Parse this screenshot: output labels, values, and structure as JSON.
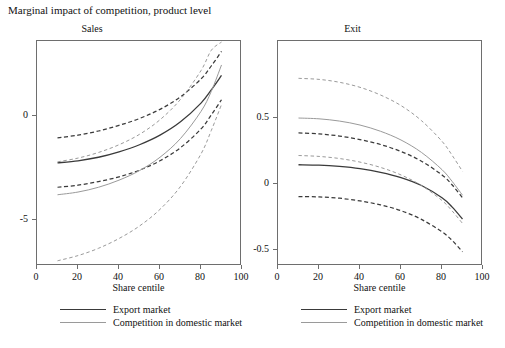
{
  "figure": {
    "title": "Marginal impact of competition, product level"
  },
  "colors": {
    "export_market": "#3a3a3a",
    "domestic_competition": "#9a9a9a",
    "axis": "#6e6e6e",
    "text": "#111111",
    "background": "#ffffff"
  },
  "legend": {
    "items": [
      {
        "label": "Export market",
        "style": "solid-dark"
      },
      {
        "label": "Competition in domestic market",
        "style": "solid-gray"
      }
    ]
  },
  "panels": [
    {
      "id": "sales",
      "title": "Sales",
      "xlabel": "Share centile",
      "xticks": [
        "0",
        "20",
        "40",
        "60",
        "80",
        "100"
      ],
      "yticks": [
        "0",
        "-5"
      ]
    },
    {
      "id": "exit",
      "title": "Exit",
      "xlabel": "Share centile",
      "xticks": [
        "0",
        "20",
        "40",
        "60",
        "80",
        "100"
      ],
      "yticks": [
        "0.5",
        "0",
        "-0.5"
      ]
    }
  ],
  "chart_data": [
    {
      "type": "line",
      "id": "sales",
      "title": "Sales",
      "subtitle": "Marginal impact of competition, product level",
      "xlabel": "Share centile",
      "ylabel": "",
      "xlim": [
        0,
        100
      ],
      "ylim": [
        -7.2,
        3.6
      ],
      "xticks": [
        0,
        20,
        40,
        60,
        80,
        100
      ],
      "yticks": [
        0,
        -5
      ],
      "grid": false,
      "legend_position": "below",
      "x": [
        10,
        20,
        30,
        40,
        50,
        60,
        70,
        80,
        85,
        90
      ],
      "series": [
        {
          "name": "Export market",
          "style": "solid",
          "color": "#3a3a3a",
          "values": [
            -2.25,
            -2.15,
            -1.98,
            -1.72,
            -1.38,
            -0.92,
            -0.28,
            0.62,
            1.25,
            1.95
          ]
        },
        {
          "name": "Export market upper 95% CI",
          "style": "dashed",
          "color": "#3a3a3a",
          "values": [
            -1.05,
            -0.92,
            -0.72,
            -0.45,
            -0.12,
            0.32,
            0.92,
            1.78,
            2.4,
            3.1
          ]
        },
        {
          "name": "Export market lower 95% CI",
          "style": "dashed",
          "color": "#3a3a3a",
          "values": [
            -3.42,
            -3.32,
            -3.15,
            -2.92,
            -2.6,
            -2.15,
            -1.52,
            -0.62,
            0.05,
            0.78
          ]
        },
        {
          "name": "Competition in domestic market",
          "style": "solid",
          "color": "#9a9a9a",
          "values": [
            -3.78,
            -3.65,
            -3.42,
            -3.08,
            -2.62,
            -1.98,
            -1.08,
            0.22,
            1.18,
            2.45
          ]
        },
        {
          "name": "Competition in domestic market upper 95% CI",
          "style": "dashed",
          "color": "#9a9a9a",
          "values": [
            -2.2,
            -2.02,
            -1.75,
            -1.38,
            -0.88,
            -0.18,
            0.8,
            2.18,
            3.15,
            3.55
          ]
        },
        {
          "name": "Competition in domestic market lower 95% CI",
          "style": "dashed",
          "color": "#9a9a9a",
          "values": [
            -6.95,
            -6.7,
            -6.35,
            -5.88,
            -5.28,
            -4.48,
            -3.38,
            -1.82,
            -0.7,
            0.55
          ]
        }
      ]
    },
    {
      "type": "line",
      "id": "exit",
      "title": "Exit",
      "subtitle": "Marginal impact of competition, product level",
      "xlabel": "Share centile",
      "ylabel": "",
      "xlim": [
        0,
        100
      ],
      "ylim": [
        -0.62,
        1.08
      ],
      "xticks": [
        0,
        20,
        40,
        60,
        80,
        100
      ],
      "yticks": [
        0.5,
        0,
        -0.5
      ],
      "grid": false,
      "legend_position": "below",
      "x": [
        10,
        20,
        30,
        40,
        50,
        60,
        70,
        80,
        85,
        90
      ],
      "series": [
        {
          "name": "Export market",
          "style": "solid",
          "color": "#3a3a3a",
          "values": [
            0.145,
            0.142,
            0.132,
            0.115,
            0.088,
            0.048,
            -0.012,
            -0.105,
            -0.175,
            -0.265
          ]
        },
        {
          "name": "Export market upper 95% CI",
          "style": "dashed",
          "color": "#3a3a3a",
          "values": [
            0.385,
            0.378,
            0.362,
            0.335,
            0.298,
            0.245,
            0.172,
            0.068,
            -0.008,
            -0.105
          ]
        },
        {
          "name": "Export market lower 95% CI",
          "style": "dashed",
          "color": "#3a3a3a",
          "values": [
            -0.095,
            -0.098,
            -0.108,
            -0.128,
            -0.158,
            -0.202,
            -0.268,
            -0.362,
            -0.428,
            -0.512
          ]
        },
        {
          "name": "Competition in domestic market",
          "style": "solid",
          "color": "#9a9a9a",
          "values": [
            0.498,
            0.492,
            0.475,
            0.445,
            0.398,
            0.332,
            0.238,
            0.108,
            0.018,
            -0.085
          ]
        },
        {
          "name": "Competition in domestic market upper 95% CI",
          "style": "dashed",
          "color": "#9a9a9a",
          "values": [
            0.798,
            0.79,
            0.768,
            0.73,
            0.672,
            0.592,
            0.478,
            0.322,
            0.215,
            0.095
          ]
        },
        {
          "name": "Competition in domestic market lower 95% CI",
          "style": "dashed",
          "color": "#9a9a9a",
          "values": [
            0.215,
            0.208,
            0.192,
            0.165,
            0.125,
            0.068,
            -0.012,
            -0.125,
            -0.205,
            -0.298
          ]
        }
      ]
    }
  ]
}
